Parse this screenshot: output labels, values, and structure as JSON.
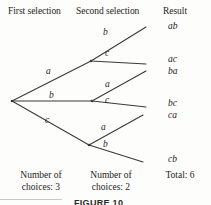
{
  "headers": {
    "first": "First selection",
    "second": "Second selection",
    "result": "Result"
  },
  "level1_labels": [
    {
      "text": "a",
      "x": 46,
      "y": 66
    },
    {
      "text": "b",
      "x": 49,
      "y": 90
    },
    {
      "text": "c",
      "x": 45,
      "y": 115
    }
  ],
  "level2_labels": [
    {
      "text": "b",
      "x": 103,
      "y": 27
    },
    {
      "text": "c",
      "x": 105,
      "y": 48
    },
    {
      "text": "a",
      "x": 105,
      "y": 79
    },
    {
      "text": "c",
      "x": 105,
      "y": 95
    },
    {
      "text": "a",
      "x": 101,
      "y": 122
    },
    {
      "text": "b",
      "x": 103,
      "y": 139
    }
  ],
  "results": [
    {
      "text": "ab",
      "y": 21
    },
    {
      "text": "ac",
      "y": 54
    },
    {
      "text": "ba",
      "y": 66
    },
    {
      "text": "bc",
      "y": 98
    },
    {
      "text": "ca",
      "y": 110
    },
    {
      "text": "cb",
      "y": 154
    }
  ],
  "footers": {
    "first_line1": "Number of",
    "first_line2": "choices:  3",
    "second_line1": "Number of",
    "second_line2": "choices:  2",
    "total": "Total:  6"
  },
  "caption": "FIGURE 10",
  "colors": {
    "background": "#fdfdfb",
    "ink": "#1b1b1b",
    "line": "#3a3a3a",
    "rule": "#c9c9c9"
  },
  "tree_geometry": {
    "root": {
      "x": 12,
      "y": 101
    },
    "nodes": [
      {
        "x": 91,
        "y": 61
      },
      {
        "x": 92,
        "y": 101
      },
      {
        "x": 89,
        "y": 145
      }
    ],
    "edges_level1": [
      {
        "x1": 12,
        "y1": 101,
        "x2": 91,
        "y2": 61
      },
      {
        "x1": 12,
        "y1": 101,
        "x2": 92,
        "y2": 101
      },
      {
        "x1": 12,
        "y1": 101,
        "x2": 89,
        "y2": 145
      }
    ],
    "edges_level2": [
      {
        "x1": 91,
        "y1": 61,
        "x2": 146,
        "y2": 27
      },
      {
        "x1": 91,
        "y1": 61,
        "x2": 146,
        "y2": 64
      },
      {
        "x1": 92,
        "y1": 101,
        "x2": 146,
        "y2": 71
      },
      {
        "x1": 92,
        "y1": 101,
        "x2": 146,
        "y2": 107
      },
      {
        "x1": 89,
        "y1": 145,
        "x2": 143,
        "y2": 115
      },
      {
        "x1": 89,
        "y1": 145,
        "x2": 143,
        "y2": 162
      }
    ]
  }
}
